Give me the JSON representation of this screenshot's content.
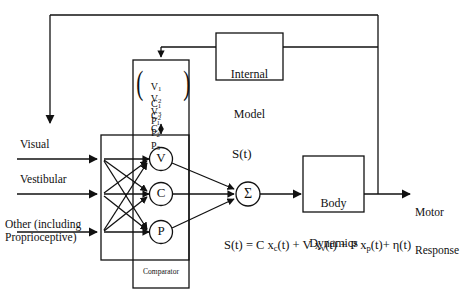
{
  "diagram": {
    "stroke_color": "#111111",
    "background": "#ffffff",
    "inputs": [
      {
        "id": "visual",
        "label": "Visual"
      },
      {
        "id": "vestibular",
        "label": "Vestibular"
      },
      {
        "id": "other",
        "label": "Other (including\nProprioceptive)"
      }
    ],
    "matrix": {
      "name": "weight-matrix",
      "rows": [
        [
          "V",
          "V",
          "V"
        ],
        [
          "C",
          "C",
          "C"
        ],
        [
          "P",
          "P",
          "P"
        ]
      ],
      "row_text": [
        "V₁1 V₁2 V₁3",
        "C₁1 C₁2 C₁3",
        "P₁1 P₁2 P₁3"
      ],
      "row1": "V",
      "row2": "C",
      "row3": "P",
      "subs": [
        "1",
        "2",
        "3"
      ],
      "open_paren": "(",
      "close_paren": ")"
    },
    "nodes": [
      {
        "id": "node-v",
        "label": "V"
      },
      {
        "id": "node-c",
        "label": "C"
      },
      {
        "id": "node-p",
        "label": "P"
      }
    ],
    "summing_node": {
      "id": "summing-junction",
      "label": "Σ"
    },
    "signal_label": "S(t)",
    "comparator_label": "Comparator",
    "boxes": [
      {
        "id": "internal-model",
        "line1": "Internal",
        "line2": "Model"
      },
      {
        "id": "body-dynamics",
        "line1": "Body",
        "line2": "Dynamics"
      }
    ],
    "output": {
      "id": "motor-response",
      "line1": "Motor",
      "line2": "Response"
    },
    "equation": {
      "lhs": "S(t)",
      "eq": "=",
      "t1_coef": "C",
      "t1_var": "x",
      "t1_sub": "c",
      "t1_arg": "(t)",
      "plus1": "+",
      "t2_coef": "V",
      "t2_var": "x",
      "t2_sub": "v",
      "t2_arg": "(t)",
      "plus2": "+",
      "t3_coef": "P",
      "t3_var": "x",
      "t3_sub": "p",
      "t3_arg": "(t)",
      "plus3": "+",
      "noise": "η(t)",
      "full_text": "S(t) = C xc(t) + V xv(t) + P xp(t) + η(t)"
    }
  }
}
